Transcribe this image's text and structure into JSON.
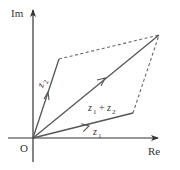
{
  "diagram": {
    "axes": {
      "x_label": "Re",
      "y_label": "Im",
      "origin_label": "O"
    },
    "vectors": [
      {
        "name": "z1",
        "label_base": "z",
        "label_sub": "1",
        "from": [
          0,
          0
        ],
        "to": "z1"
      },
      {
        "name": "z2",
        "label_base": "z",
        "label_sub": "2",
        "from": [
          0,
          0
        ],
        "to": "z2"
      },
      {
        "name": "z1+z2",
        "label": "z1 + z2",
        "from": [
          0,
          0
        ],
        "to": "z1+z2"
      }
    ],
    "labels": {
      "z1_base": "z",
      "z1_sub": "1",
      "z2_base": "z",
      "z2_sub": "2",
      "sum_z1_base": "z",
      "sum_z1_sub": "1",
      "sum_plus": "+",
      "sum_z2_base": "z",
      "sum_z2_sub": "2"
    },
    "dashed_edges": [
      "z2 → z1+z2",
      "z1 → z1+z2"
    ],
    "colors": {
      "axis": "#333333",
      "vector": "#555555",
      "dashed": "#666666"
    }
  }
}
